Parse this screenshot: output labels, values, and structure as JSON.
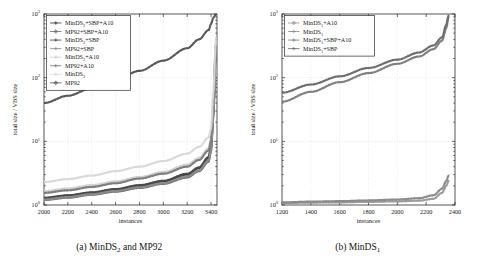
{
  "figure": {
    "panels": [
      {
        "id": "panel-a",
        "caption_prefix": "(a)",
        "caption_main": "MinDS",
        "caption_sub": "2",
        "caption_suffix": " and MP92",
        "caption_full": "(a) MinDS2 and MP92"
      },
      {
        "id": "panel-b",
        "caption_prefix": "(b)",
        "caption_main": "MinDS",
        "caption_sub": "1",
        "caption_suffix": "",
        "caption_full": "(b) MinDS1"
      }
    ]
  },
  "chart_data": [
    {
      "type": "line",
      "panel": "a",
      "title": "(a) MinDS2 and MP92",
      "xlabel": "instances",
      "ylabel": "total size / VBS size",
      "xlim": [
        2000,
        3450
      ],
      "ylim": [
        1,
        1000
      ],
      "yscale": "log",
      "xticks": [
        2000,
        2200,
        2400,
        2600,
        2800,
        3000,
        3200,
        3400
      ],
      "xticklabels": [
        "2000",
        "2200",
        "2400",
        "2600",
        "2800",
        "3000",
        "3200",
        "3400"
      ],
      "yticks": [
        1,
        10,
        100,
        1000
      ],
      "yticklabels": [
        "10^0",
        "10^1",
        "10^2",
        "10^3"
      ],
      "grid": true,
      "legend_position": "upper left",
      "series": [
        {
          "name": "MinDS2+SBP+A10",
          "label_main": "MinDS",
          "label_sub": "2",
          "label_suffix": "+SBP+A10",
          "color": "#3a3a3a",
          "marker": "plus",
          "x": [
            2000,
            2200,
            2400,
            2600,
            2800,
            3000,
            3200,
            3300,
            3380,
            3400,
            3420,
            3440
          ],
          "values": [
            1.28,
            1.4,
            1.55,
            1.75,
            2.0,
            2.35,
            3.0,
            3.8,
            5.5,
            8.0,
            30,
            300
          ]
        },
        {
          "name": "MP92+SBP+A10",
          "label_main": "MP92+SBP+A10",
          "label_sub": "",
          "label_suffix": "",
          "color": "#6e6e6e",
          "marker": "diamond",
          "x": [
            2000,
            2200,
            2400,
            2600,
            2800,
            3000,
            3200,
            3300,
            3380,
            3400,
            3420,
            3440
          ],
          "values": [
            1.2,
            1.3,
            1.45,
            1.62,
            1.85,
            2.15,
            2.7,
            3.4,
            4.8,
            7.0,
            26,
            260
          ]
        },
        {
          "name": "MinDS2+SBP",
          "label_main": "MinDS",
          "label_sub": "2",
          "label_suffix": "+SBP",
          "color": "#4a4a4a",
          "marker": "star",
          "x": [
            2000,
            2200,
            2400,
            2600,
            2800,
            3000,
            3200,
            3300,
            3380,
            3400,
            3420,
            3440
          ],
          "values": [
            1.3,
            1.42,
            1.58,
            1.78,
            2.05,
            2.4,
            3.1,
            3.9,
            5.7,
            8.3,
            32,
            310
          ]
        },
        {
          "name": "MP92+SBP",
          "label_main": "MP92+SBP",
          "label_sub": "",
          "label_suffix": "",
          "color": "#8c8c8c",
          "marker": "plus",
          "x": [
            2000,
            2200,
            2400,
            2600,
            2800,
            3000,
            3200,
            3300,
            3380,
            3400,
            3420,
            3440
          ],
          "values": [
            1.22,
            1.33,
            1.48,
            1.66,
            1.9,
            2.2,
            2.8,
            3.5,
            5.0,
            7.3,
            27,
            270
          ]
        },
        {
          "name": "MinDS2+A10",
          "label_main": "MinDS",
          "label_sub": "2",
          "label_suffix": "+A10",
          "color": "#cfcfcf",
          "marker": "none",
          "x": [
            2000,
            2200,
            2400,
            2600,
            2800,
            3000,
            3200,
            3300,
            3380,
            3400,
            3420,
            3440
          ],
          "values": [
            1.65,
            1.82,
            2.05,
            2.35,
            2.75,
            3.3,
            4.3,
            5.5,
            7.8,
            11,
            40,
            330
          ]
        },
        {
          "name": "MP92+A10",
          "label_main": "MP92+A10",
          "label_sub": "",
          "label_suffix": "",
          "color": "#7a7a7a",
          "marker": "star",
          "x": [
            2000,
            2200,
            2400,
            2600,
            2800,
            3000,
            3200,
            3300,
            3380,
            3400,
            3420,
            3440
          ],
          "values": [
            1.55,
            1.7,
            1.92,
            2.2,
            2.6,
            3.1,
            4.0,
            5.1,
            7.2,
            10.2,
            38,
            320
          ]
        },
        {
          "name": "MinDS2",
          "label_main": "MinDS",
          "label_sub": "2",
          "label_suffix": "",
          "color": "#d8d8d8",
          "marker": "none",
          "x": [
            2000,
            2200,
            2400,
            2600,
            2800,
            3000,
            3200,
            3300,
            3380,
            3400,
            3420,
            3440
          ],
          "values": [
            2.3,
            2.55,
            2.9,
            3.4,
            4.0,
            4.9,
            6.4,
            8.2,
            11.5,
            16,
            60,
            420
          ]
        },
        {
          "name": "MP92",
          "label_main": "MP92",
          "label_sub": "",
          "label_suffix": "",
          "color": "#555555",
          "marker": "diamond",
          "x": [
            2000,
            2200,
            2400,
            2600,
            2800,
            3000,
            3200,
            3300,
            3380,
            3400,
            3420,
            3440
          ],
          "values": [
            40,
            52,
            68,
            92,
            128,
            185,
            290,
            400,
            560,
            700,
            880,
            980
          ]
        }
      ]
    },
    {
      "type": "line",
      "panel": "b",
      "title": "(b) MinDS1",
      "xlabel": "instances",
      "ylabel": "total size / VBS size",
      "xlim": [
        1200,
        2400
      ],
      "ylim": [
        1,
        1000
      ],
      "yscale": "log",
      "xticks": [
        1200,
        1400,
        1600,
        1800,
        2000,
        2200,
        2400
      ],
      "xticklabels": [
        "1200",
        "1400",
        "1600",
        "1800",
        "2000",
        "2200",
        "2400"
      ],
      "yticks": [
        1,
        10,
        100,
        1000
      ],
      "yticklabels": [
        "10^0",
        "10^1",
        "10^2",
        "10^3"
      ],
      "grid": true,
      "legend_position": "upper left",
      "series": [
        {
          "name": "MinDS1+A10",
          "label_main": "MinDS",
          "label_sub": "1",
          "label_suffix": "+A10",
          "color": "#9a9a9a",
          "marker": "diamond",
          "x": [
            1200,
            1400,
            1600,
            1800,
            2000,
            2150,
            2250,
            2310,
            2340,
            2355
          ],
          "values": [
            1.07,
            1.09,
            1.1,
            1.12,
            1.14,
            1.17,
            1.25,
            1.55,
            2.0,
            2.4
          ]
        },
        {
          "name": "MinDS1",
          "label_main": "MinDS",
          "label_sub": "1",
          "label_suffix": "",
          "color": "#8a8a8a",
          "marker": "star",
          "x": [
            1200,
            1400,
            1600,
            1800,
            2000,
            2150,
            2250,
            2310,
            2340,
            2355
          ],
          "values": [
            1.1,
            1.13,
            1.15,
            1.18,
            1.22,
            1.28,
            1.42,
            1.8,
            2.4,
            2.9
          ]
        },
        {
          "name": "MinDS1+SBP+A10",
          "label_main": "MinDS",
          "label_sub": "1",
          "label_suffix": "+SBP+A10",
          "color": "#7d7d7d",
          "marker": "star",
          "x": [
            1200,
            1400,
            1600,
            1800,
            2000,
            2150,
            2250,
            2310,
            2340,
            2355
          ],
          "values": [
            42,
            60,
            85,
            118,
            165,
            215,
            280,
            380,
            600,
            900
          ]
        },
        {
          "name": "MinDS1+SBP",
          "label_main": "MinDS",
          "label_sub": "1",
          "label_suffix": "+SBP",
          "color": "#6a6a6a",
          "marker": "plus",
          "x": [
            1200,
            1400,
            1600,
            1800,
            2000,
            2150,
            2250,
            2310,
            2340,
            2355
          ],
          "values": [
            58,
            78,
            105,
            142,
            192,
            248,
            320,
            430,
            680,
            950
          ]
        }
      ]
    }
  ]
}
